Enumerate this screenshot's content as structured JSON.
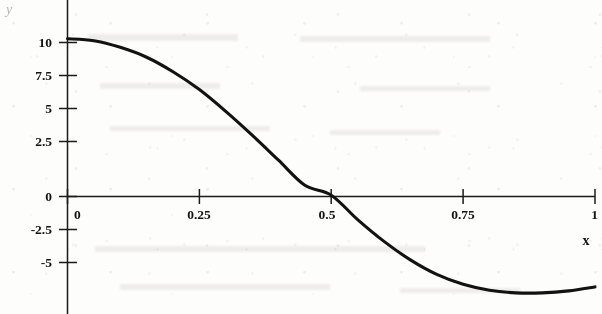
{
  "chart_data": {
    "type": "line",
    "title": "",
    "xlabel": "x",
    "ylabel": "y",
    "xlim": [
      -0.02,
      1.0
    ],
    "ylim": [
      -8.2,
      12.4
    ],
    "grid": false,
    "legend": null,
    "xticks": [
      0,
      0.25,
      0.5,
      0.75,
      1
    ],
    "xticklabels": [
      "0",
      "0.25",
      "0.5",
      "0.75",
      "1"
    ],
    "yticks": [
      10,
      7.5,
      5,
      2.5,
      0,
      -2.5,
      -5
    ],
    "yticklabels": [
      "10",
      "7.5",
      "5",
      "2.5",
      "0",
      "-2.5",
      "-5"
    ],
    "zero_crossing_x": 0.51,
    "series": [
      {
        "name": "curve",
        "color": "#121212",
        "x": [
          0.0,
          0.05,
          0.1,
          0.15,
          0.2,
          0.25,
          0.3,
          0.35,
          0.4,
          0.45,
          0.5,
          0.55,
          0.6,
          0.65,
          0.7,
          0.75,
          0.8,
          0.85,
          0.9,
          0.95,
          1.0
        ],
        "y": [
          11.95,
          11.8,
          11.3,
          10.55,
          9.45,
          8.1,
          6.45,
          4.65,
          2.75,
          0.85,
          0.1,
          -1.75,
          -3.4,
          -4.8,
          -5.9,
          -6.65,
          -7.1,
          -7.3,
          -7.3,
          -7.15,
          -6.85
        ]
      }
    ]
  },
  "labels": {
    "y_axis_name": "y",
    "x_axis_name": "x"
  },
  "style": {
    "curve_color": "#121212",
    "axis_color": "#1b1b1b",
    "background": "#fdfdfc",
    "text_color": "#141414"
  }
}
